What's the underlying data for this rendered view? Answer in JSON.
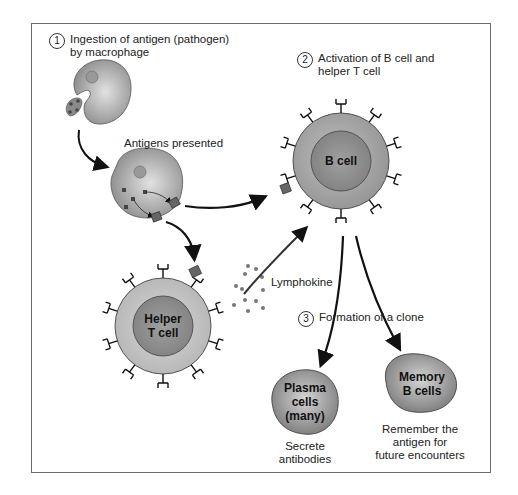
{
  "steps": [
    {
      "number": "1",
      "line1": "Ingestion of antigen (pathogen)",
      "line2": "by macrophage"
    },
    {
      "number": "2",
      "line1": "Activation of B cell and",
      "line2": "helper T cell"
    },
    {
      "number": "3",
      "line1": "Formation of a clone"
    }
  ],
  "labels": {
    "antigens_presented": "Antigens presented",
    "lymphokine": "Lymphokine"
  },
  "cells": {
    "b_cell": {
      "line1": "B cell"
    },
    "helper_t_cell": {
      "line1": "Helper",
      "line2": "T cell"
    },
    "plasma_cells": {
      "line1": "Plasma",
      "line2": "cells",
      "line3": "(many)"
    },
    "memory_b_cells": {
      "line1": "Memory",
      "line2": "B cells"
    }
  },
  "captions": {
    "plasma": {
      "line1": "Secrete",
      "line2": "antibodies"
    },
    "memory": {
      "line1": "Remember the",
      "line2": "antigen for",
      "line3": "future encounters"
    }
  },
  "colors": {
    "cell_outer": "#a8a8a8",
    "cell_inner": "#8c8c8c",
    "helper_outer": "#c8c8c8",
    "arrow": "#111111",
    "border": "#6a6a6a"
  }
}
